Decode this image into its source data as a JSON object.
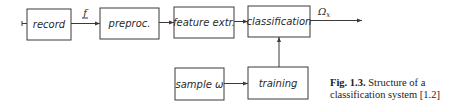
{
  "diagram": {
    "nodes": [
      {
        "id": "record",
        "label": "record"
      },
      {
        "id": "preproc",
        "label": "preproc."
      },
      {
        "id": "feature",
        "label": "feature extr."
      },
      {
        "id": "classification",
        "label": "classification"
      },
      {
        "id": "sample",
        "label": "sample ω"
      },
      {
        "id": "training",
        "label": "training"
      }
    ],
    "edges": [
      {
        "from": "input",
        "to": "record"
      },
      {
        "from": "record",
        "to": "preproc",
        "label": "f"
      },
      {
        "from": "preproc",
        "to": "feature"
      },
      {
        "from": "feature",
        "to": "classification"
      },
      {
        "from": "classification",
        "to": "output",
        "label": "Ωx"
      },
      {
        "from": "sample",
        "to": "training"
      },
      {
        "from": "training",
        "to": "classification"
      }
    ],
    "labels": {
      "f": "f",
      "omega": "Ω",
      "omega_sub": "x"
    }
  },
  "caption": {
    "fig": "Fig. 1.3.",
    "line1": "Structure of a",
    "line2": "classification system [1.2]"
  }
}
